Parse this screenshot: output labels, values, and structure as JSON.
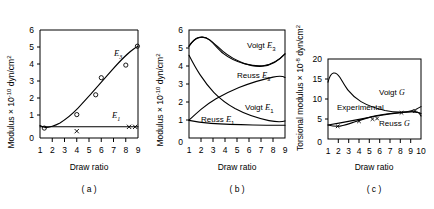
{
  "figure": {
    "panels": [
      "a",
      "b",
      "c"
    ],
    "captions": {
      "a": "( a )",
      "b": "( b )",
      "c": "( c )"
    },
    "xlabel": "Draw ratio"
  },
  "chart_data": [
    {
      "type": "scatter",
      "panel": "a",
      "caption": "( a )",
      "title": "",
      "xlabel": "Draw ratio",
      "ylabel": "Modulus × 10⁻¹⁰ dyn/cm²",
      "ylabel_parts": {
        "prefix": "Modulus × 10",
        "exponent": "-10",
        "suffix": " dyn/cm",
        "suffix_exponent": "2"
      },
      "xlim": [
        1,
        9
      ],
      "ylim": [
        0,
        6
      ],
      "xticks": [
        1,
        2,
        3,
        4,
        5,
        6,
        7,
        8,
        9
      ],
      "yticks": [
        0,
        1,
        2,
        3,
        4,
        5,
        6
      ],
      "grid": false,
      "legend": "inline-annotations",
      "series": [
        {
          "name": "E3",
          "label": "E",
          "label_sub": "3",
          "style": "curve-with-open-circles",
          "marker": "o",
          "x": [
            1.0,
            1.4,
            2.0,
            2.6,
            3.2,
            4.0,
            4.6,
            5.2,
            5.6,
            6.2,
            7.0,
            7.8,
            8.4,
            9.0
          ],
          "values": [
            0.7,
            0.58,
            0.62,
            0.75,
            0.95,
            1.3,
            1.65,
            2.1,
            2.4,
            2.95,
            3.6,
            4.3,
            4.7,
            5.1
          ],
          "points_x": [
            1.35,
            4.0,
            5.55,
            6.0,
            8.0,
            8.95
          ],
          "points_y": [
            0.55,
            1.3,
            2.4,
            3.35,
            4.05,
            5.1
          ]
        },
        {
          "name": "E1",
          "label": "E",
          "label_sub": "1",
          "style": "flat-line-with-x-markers",
          "marker": "x",
          "x": [
            1.0,
            9.0
          ],
          "values": [
            0.62,
            0.62
          ],
          "points_x": [
            4.0,
            8.1,
            8.9
          ],
          "points_y": [
            0.62,
            0.62,
            0.62
          ]
        }
      ]
    },
    {
      "type": "line",
      "panel": "b",
      "caption": "( b )",
      "title": "",
      "xlabel": "Draw ratio",
      "ylabel": "Modulus × 10⁻¹⁰ dyn/cm²",
      "ylabel_parts": {
        "prefix": "Modulus × 10",
        "exponent": "-10",
        "suffix": " dyn/cm",
        "suffix_exponent": "2"
      },
      "xlim": [
        1,
        9
      ],
      "ylim": [
        0,
        6
      ],
      "xticks": [
        1,
        2,
        3,
        4,
        5,
        6,
        7,
        8,
        9
      ],
      "yticks": [
        0,
        1,
        2,
        3,
        4,
        5,
        6
      ],
      "grid": false,
      "legend": "inline-annotations",
      "series": [
        {
          "name": "Voigt E3",
          "label": "Voigt E",
          "label_sub": "3",
          "x": [
            1.0,
            1.3,
            1.7,
            2.1,
            2.5,
            3.0,
            3.6,
            4.2,
            5.0,
            6.0,
            7.0,
            8.0,
            9.0
          ],
          "values": [
            5.1,
            5.4,
            5.62,
            5.7,
            5.68,
            5.58,
            5.42,
            5.28,
            5.12,
            4.95,
            4.82,
            4.72,
            4.66
          ]
        },
        {
          "name": "Reuss E3",
          "label": "Reuss E",
          "label_sub": "3",
          "x": [
            1.0,
            1.4,
            2.0,
            2.6,
            3.2,
            4.0,
            5.0,
            6.0,
            7.0,
            8.0,
            9.0
          ],
          "values": [
            1.0,
            1.22,
            1.55,
            1.85,
            2.1,
            2.4,
            2.72,
            2.96,
            3.12,
            3.26,
            3.36
          ]
        },
        {
          "name": "Voigt E1",
          "label": "Voigt E",
          "label_sub": "1",
          "x": [
            1.0,
            1.3,
            1.7,
            2.2,
            2.8,
            3.4,
            4.0,
            5.0,
            6.0,
            7.0,
            8.0,
            9.0
          ],
          "values": [
            4.6,
            3.85,
            3.1,
            2.5,
            2.0,
            1.68,
            1.45,
            1.2,
            1.08,
            1.0,
            0.97,
            0.95
          ]
        },
        {
          "name": "Reuss E1",
          "label": "Reuss E",
          "label_sub": "1",
          "x": [
            1.0,
            1.6,
            2.4,
            3.4,
            4.5,
            6.0,
            7.5,
            9.0
          ],
          "values": [
            0.98,
            0.88,
            0.82,
            0.78,
            0.75,
            0.73,
            0.72,
            0.71
          ]
        }
      ]
    },
    {
      "type": "line",
      "panel": "c",
      "caption": "( c )",
      "title": "",
      "xlabel": "Draw ratio",
      "ylabel": "Torsional modulus × 10⁻⁸ dyn/cm²",
      "ylabel_parts": {
        "prefix": "Torsional  modulus × 10",
        "exponent": "-8",
        "suffix": " dyn/cm",
        "suffix_exponent": "2"
      },
      "xlim": [
        1,
        10
      ],
      "ylim": [
        0,
        20
      ],
      "xticks": [
        1,
        2,
        3,
        4,
        5,
        6,
        7,
        8,
        9,
        10
      ],
      "yticks": [
        0,
        5,
        10,
        15,
        20
      ],
      "grid": false,
      "legend": "inline-annotations",
      "series": [
        {
          "name": "Voigt G",
          "label": "Voigt G",
          "label_italic": "G",
          "x": [
            1.0,
            1.15,
            1.35,
            1.6,
            2.0,
            2.5,
            3.0,
            3.6,
            4.2,
            5.0,
            6.0,
            7.0,
            8.0,
            9.0,
            10.0
          ],
          "values": [
            14.2,
            16.2,
            16.5,
            16.0,
            14.6,
            13.2,
            12.2,
            11.3,
            10.6,
            9.9,
            9.2,
            8.7,
            8.4,
            8.2,
            8.1
          ]
        },
        {
          "name": "Experimental",
          "label": "Experimental",
          "marker": "x",
          "x": [
            1.0,
            2.0,
            3.0,
            4.0,
            5.0,
            5.6,
            6.5,
            8.0,
            8.6,
            9.6
          ],
          "values": [
            3.5,
            3.8,
            4.2,
            4.55,
            4.95,
            5.2,
            5.6,
            6.1,
            6.2,
            6.4
          ],
          "points_x": [
            1.9,
            4.0,
            5.3,
            5.75,
            8.3,
            9.6
          ],
          "points_y": [
            3.2,
            4.3,
            4.85,
            5.0,
            6.05,
            6.4
          ]
        },
        {
          "name": "Reuss G",
          "label": "Reuss G",
          "label_italic": "G",
          "x": [
            1.0,
            1.6,
            2.4,
            3.2,
            4.2,
            5.2,
            6.2,
            7.2,
            8.2,
            9.2,
            10.0
          ],
          "values": [
            3.5,
            3.3,
            3.45,
            3.8,
            4.3,
            4.8,
            5.2,
            5.45,
            5.6,
            5.7,
            5.75
          ]
        }
      ]
    }
  ]
}
